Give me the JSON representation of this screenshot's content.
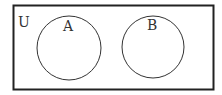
{
  "diagram": {
    "type": "venn",
    "universe_label": "U",
    "sets": [
      {
        "label": "A"
      },
      {
        "label": "B"
      }
    ],
    "relationship": "disjoint"
  }
}
